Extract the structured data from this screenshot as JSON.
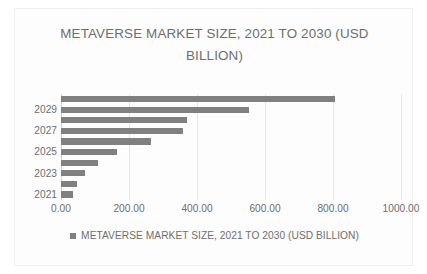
{
  "chart_data": {
    "type": "bar",
    "orientation": "horizontal",
    "title": "METAVERSE MARKET SIZE, 2021 TO 2030 (USD BILLION)",
    "title_line1": "METAVERSE MARKET SIZE, 2021 TO 2030 (USD",
    "title_line2": "BILLION)",
    "xlabel": "",
    "ylabel": "",
    "categories": [
      "2030",
      "2029",
      "2028",
      "2027",
      "2026",
      "2025",
      "2024",
      "2023",
      "2022",
      "2021"
    ],
    "values": [
      807,
      553,
      370,
      359,
      265,
      165,
      109,
      71,
      47,
      35
    ],
    "series": [
      {
        "name": "METAVERSE MARKET SIZE, 2021 TO 2030 (USD BILLION)",
        "color": "#808080",
        "values": [
          807,
          553,
          370,
          359,
          265,
          165,
          109,
          71,
          47,
          35
        ]
      }
    ],
    "xlim": [
      0,
      1000
    ],
    "xticks": [
      0,
      200,
      400,
      600,
      800,
      1000
    ],
    "xtick_labels": [
      "0.00",
      "200.00",
      "400.00",
      "600.00",
      "800.00",
      "1000.00"
    ],
    "ytick_labels": [
      "2029",
      "2027",
      "2025",
      "2023",
      "2021"
    ],
    "ytick_values": [
      "2029",
      "2027",
      "2025",
      "2023",
      "2021"
    ],
    "grid": "vertical",
    "legend": {
      "position": "bottom",
      "entries": [
        {
          "label": "METAVERSE MARKET SIZE, 2021 TO 2030 (USD BILLION)",
          "color": "#808080"
        }
      ]
    },
    "colors": {
      "bar": "#808080",
      "text": "#6e6e6e",
      "gridline": "#e6e6e6",
      "axis": "#d2d2d2",
      "background": "#fdfdfd"
    }
  }
}
